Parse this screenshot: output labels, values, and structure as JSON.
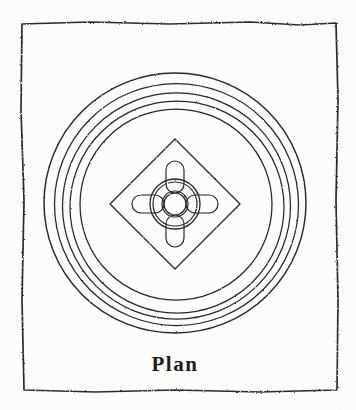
{
  "figure": {
    "title": "Plan",
    "caption": "Plan",
    "kind": "engraved-plan-drawing",
    "medium": "line engraving on aged paper",
    "colors": {
      "ink": "#272727",
      "paper": "#fdfdfc",
      "frame": "#2b2b2b"
    },
    "frame": {
      "name": "hand-drawn-border",
      "left": 21,
      "top": 23,
      "right": 337,
      "bottom": 391,
      "style": "irregular freehand rectangle"
    },
    "center": {
      "x": 175,
      "y": 203
    },
    "rings": [
      {
        "label": "ring-1-outermost",
        "radius": 131,
        "cx": 175,
        "cy": 203
      },
      {
        "label": "ring-2",
        "radius": 122,
        "cx": 176,
        "cy": 204
      },
      {
        "label": "ring-3",
        "radius": 114,
        "cx": 176,
        "cy": 205
      },
      {
        "label": "ring-4",
        "radius": 107,
        "cx": 177,
        "cy": 206
      },
      {
        "label": "ring-5-innermost",
        "radius": 96,
        "cx": 176,
        "cy": 204
      }
    ],
    "diamond": {
      "label": "rotated-square-panel",
      "cx": 175,
      "cy": 204,
      "half_diagonal": 65,
      "rotation_deg": 45
    },
    "hub": {
      "label": "central-boss",
      "cx": 175,
      "cy": 204,
      "outer_radius": 25,
      "mid_radius": 22,
      "inner_radius": 13,
      "core_radius": 11
    },
    "lobes": {
      "label": "four-cardinal-lobes",
      "count": 4,
      "directions": [
        "north",
        "east",
        "south",
        "west"
      ],
      "length": 22,
      "width": 18,
      "corner_radius": 9
    },
    "caption_position": {
      "x": 175,
      "y": 371
    }
  }
}
